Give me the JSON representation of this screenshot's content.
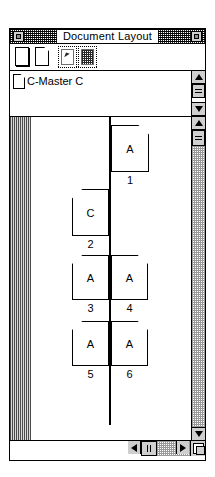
{
  "window": {
    "title": "Document Layout",
    "close_box": "close-box",
    "zoom_box": "zoom-box"
  },
  "toolbar": {
    "items": [
      {
        "name": "single-page-tool",
        "icon": "page-icon",
        "enabled": true,
        "label": "Single Page"
      },
      {
        "name": "facing-pages-tool",
        "icon": "page-fold-icon",
        "enabled": true,
        "label": "Facing Pages"
      },
      {
        "name": "page-pointer-tool",
        "icon": "page-pointer-icon",
        "enabled": false,
        "label": "Page Pointer"
      },
      {
        "name": "grid-tool",
        "icon": "grid-icon",
        "enabled": false,
        "label": "Grid"
      }
    ]
  },
  "master_list": {
    "items": [
      {
        "icon": "page-icon",
        "label": "C-Master C"
      }
    ],
    "scrollbar": {
      "up": "scroll-up-arrow",
      "down": "scroll-down-arrow",
      "thumb": "scroll-thumb"
    }
  },
  "layout": {
    "pages": [
      {
        "number": "1",
        "master": "A",
        "side": "right",
        "fold": "top-right"
      },
      {
        "number": "2",
        "master": "C",
        "side": "left",
        "fold": "top-left"
      },
      {
        "number": "3",
        "master": "A",
        "side": "left",
        "fold": "top-left"
      },
      {
        "number": "4",
        "master": "A",
        "side": "right",
        "fold": "top-right"
      },
      {
        "number": "5",
        "master": "A",
        "side": "left",
        "fold": "top-left"
      },
      {
        "number": "6",
        "master": "A",
        "side": "right",
        "fold": "top-right"
      }
    ],
    "vscrollbar": {
      "up": "scroll-up-arrow",
      "down": "scroll-down-arrow",
      "thumb": "scroll-thumb"
    },
    "hscrollbar": {
      "left": "scroll-left-arrow",
      "right": "scroll-right-arrow",
      "thumb": "scroll-thumb"
    },
    "grow_box": "resize-grow-box"
  },
  "colors": {
    "frame": "#000000",
    "chrome": "#cfcfcf",
    "margin": "#6e6e6e",
    "paper": "#ffffff"
  }
}
